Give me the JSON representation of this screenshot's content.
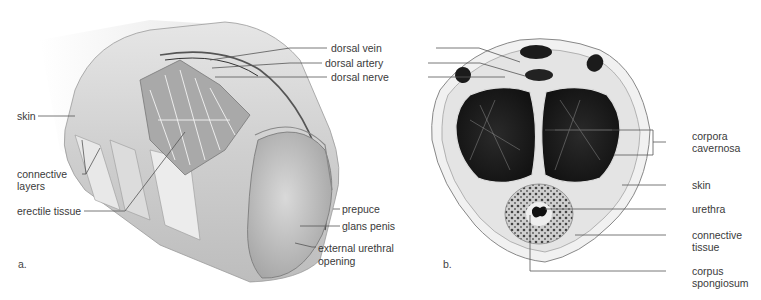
{
  "panels": [
    {
      "id": "a",
      "letter": "a.",
      "title": "Longitudinal cutaway view",
      "labels": {
        "skin": "skin",
        "connective_layers_1": "connective",
        "connective_layers_2": "layers",
        "erectile_tissue": "erectile tissue",
        "dorsal_vein": "dorsal vein",
        "dorsal_artery": "dorsal artery",
        "dorsal_nerve": "dorsal nerve",
        "prepuce": "prepuce",
        "glans_penis": "glans penis",
        "external_urethral_opening_1": "external urethral",
        "external_urethral_opening_2": "opening"
      }
    },
    {
      "id": "b",
      "letter": "b.",
      "title": "Cross section",
      "labels": {
        "corpora_cavernosa_1": "corpora",
        "corpora_cavernosa_2": "cavernosa",
        "skin": "skin",
        "urethra": "urethra",
        "connective_tissue_1": "connective",
        "connective_tissue_2": "tissue",
        "corpus_spongiosum_1": "corpus",
        "corpus_spongiosum_2": "spongiosum"
      }
    }
  ]
}
